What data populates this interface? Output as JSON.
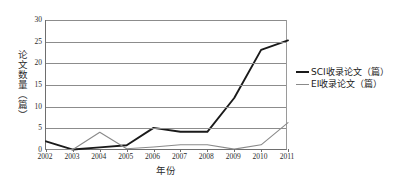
{
  "chart_data": {
    "type": "line",
    "title": "",
    "xlabel": "年份",
    "ylabel": "论文数量（篇）",
    "categories": [
      "2002",
      "2003",
      "2004",
      "2005",
      "2006",
      "2007",
      "2008",
      "2009",
      "2010",
      "2011"
    ],
    "x": [
      2002,
      2003,
      2004,
      2005,
      2006,
      2007,
      2008,
      2009,
      2010,
      2011
    ],
    "ylim": [
      0,
      30
    ],
    "xlim": [
      2002,
      2011
    ],
    "yticks": [
      0,
      5,
      10,
      15,
      20,
      25,
      30
    ],
    "grid": "horizontal",
    "legend_position": "right",
    "series": [
      {
        "name": "SCI收录论文（篇）",
        "color": "#1a1a1a",
        "width": 1.9,
        "values": [
          2.0,
          0.1,
          0.6,
          1.1,
          5.1,
          4.2,
          4.2,
          12.0,
          23.1,
          25.3
        ]
      },
      {
        "name": "EI收录论文（篇）",
        "color": "#8a8a8a",
        "width": 1.1,
        "values": [
          0.1,
          0.1,
          4.1,
          0.3,
          0.7,
          1.2,
          1.2,
          0.2,
          1.2,
          6.3
        ]
      }
    ]
  },
  "axis": {
    "y_tick_labels": [
      "0",
      "5",
      "10",
      "15",
      "20",
      "25",
      "30"
    ],
    "y_axis_title": "论文数量（篇）",
    "x_axis_title": "年份",
    "x_tick_labels": [
      "2002",
      "2003",
      "2004",
      "2005",
      "2006",
      "2007",
      "2008",
      "2009",
      "2010",
      "2011"
    ]
  },
  "legend": {
    "items": [
      {
        "label": "SCI收录论文（篇）",
        "color": "#1a1a1a"
      },
      {
        "label": "EI收录论文（篇）",
        "color": "#8a8a8a"
      }
    ]
  },
  "colors": {
    "sci_line": "#1a1a1a",
    "ei_line": "#8a8a8a",
    "gridline": "#8c8c8c",
    "axis": "#6e6e6e",
    "background": "#ffffff"
  }
}
